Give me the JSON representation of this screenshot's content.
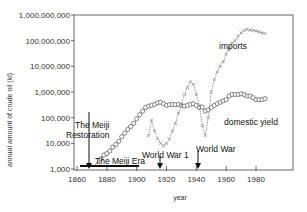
{
  "chart_data": {
    "type": "line",
    "title": "",
    "xlabel": "year",
    "ylabel": "annual amount of crude oil (kl)",
    "yscale": "log",
    "xlim": [
      1858,
      1990
    ],
    "ylim": [
      1000,
      1000000000
    ],
    "grid": false,
    "x_ticks": [
      1860,
      1880,
      1900,
      1920,
      1940,
      1960,
      1980
    ],
    "x_tick_labels": [
      "1860",
      "1880",
      "1900",
      "1920",
      "1940",
      "1960",
      "1980"
    ],
    "y_ticks": [
      1000,
      10000,
      100000,
      1000000,
      10000000,
      100000000,
      1000000000
    ],
    "y_tick_labels": [
      "1,000",
      "10,000",
      "100,000",
      "1,000,000",
      "10,000,000",
      "100,000,000",
      "1,000,000,000"
    ],
    "series": [
      {
        "name": "domestic yield",
        "marker": "circle-open",
        "x": [
          1874,
          1876,
          1878,
          1880,
          1882,
          1884,
          1886,
          1888,
          1890,
          1892,
          1894,
          1896,
          1898,
          1900,
          1902,
          1904,
          1906,
          1908,
          1910,
          1912,
          1914,
          1916,
          1918,
          1920,
          1922,
          1924,
          1926,
          1928,
          1930,
          1932,
          1934,
          1936,
          1938,
          1940,
          1942,
          1944,
          1946,
          1948,
          1950,
          1952,
          1954,
          1956,
          1958,
          1960,
          1962,
          1964,
          1966,
          1968,
          1970,
          1972,
          1974,
          1976,
          1978,
          1980,
          1982,
          1984,
          1986
        ],
        "values": [
          1500,
          2500,
          3500,
          4000,
          5000,
          7000,
          9000,
          12000,
          18000,
          25000,
          35000,
          45000,
          60000,
          90000,
          130000,
          180000,
          250000,
          280000,
          300000,
          330000,
          380000,
          400000,
          350000,
          300000,
          320000,
          330000,
          320000,
          330000,
          300000,
          280000,
          300000,
          330000,
          350000,
          300000,
          250000,
          260000,
          180000,
          200000,
          250000,
          300000,
          350000,
          400000,
          450000,
          500000,
          700000,
          800000,
          800000,
          800000,
          850000,
          800000,
          700000,
          700000,
          600000,
          500000,
          500000,
          500000,
          550000
        ]
      },
      {
        "name": "imports",
        "marker": "x",
        "x": [
          1908,
          1910,
          1912,
          1914,
          1916,
          1918,
          1920,
          1922,
          1924,
          1926,
          1928,
          1930,
          1932,
          1934,
          1936,
          1938,
          1940,
          1942,
          1944,
          1946,
          1948,
          1950,
          1952,
          1954,
          1956,
          1958,
          1960,
          1962,
          1964,
          1966,
          1968,
          1970,
          1972,
          1974,
          1976,
          1978,
          1980,
          1982,
          1984,
          1986
        ],
        "values": [
          20000,
          80000,
          30000,
          15000,
          10000,
          8000,
          10000,
          15000,
          30000,
          60000,
          150000,
          300000,
          800000,
          1500000,
          2500000,
          2000000,
          800000,
          300000,
          50000,
          20000,
          100000,
          1000000,
          3000000,
          6000000,
          10000000,
          15000000,
          30000000,
          50000000,
          80000000,
          100000000,
          150000000,
          200000000,
          250000000,
          280000000,
          260000000,
          250000000,
          240000000,
          220000000,
          200000000,
          190000000
        ]
      }
    ],
    "annotations": [
      {
        "text": "The Meiji Restoration",
        "x": 1868,
        "arrow_down_to": 1000
      },
      {
        "text": "The Meiji Era",
        "x_range": [
          1868,
          1912
        ]
      },
      {
        "text": "World War 1",
        "x": 1914,
        "arrow_down_to": 1000
      },
      {
        "text": "World War",
        "x": 1939,
        "arrow_down_to": 1000
      },
      {
        "text": "imports",
        "near_series": "imports"
      },
      {
        "text": "domestic yield",
        "near_series": "domestic yield"
      }
    ]
  },
  "labels": {
    "xlabel": "year",
    "ylabel": "annual amount of crude oil (kl)",
    "imports": "imports",
    "domestic": "domestic yield",
    "meiji_restoration_1": "The Meiji",
    "meiji_restoration_2": "Restoration",
    "meiji_era": "The Meiji Era",
    "ww1": "World War 1",
    "ww2": "World War"
  }
}
